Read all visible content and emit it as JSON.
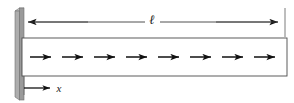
{
  "figure": {
    "kind": "cantilever-beam-diagram",
    "caption": "",
    "background_color": "#ffffff",
    "stroke_color": "#4a4a4a",
    "arrow_color": "#111111",
    "wall": {
      "label": "fixed-support-wall",
      "face_color": "#9a9a9a",
      "edge_color": "#6e6e6e",
      "top_color": "#c8c8c8",
      "x": 15,
      "y_top": 8,
      "y_bottom": 97,
      "width": 9
    },
    "dimension": {
      "label": "ℓ",
      "label_x": 152,
      "label_y": 20,
      "line_y": 22,
      "x_start": 22,
      "x_end": 284,
      "extension_line_x": 285,
      "extension_top": 8,
      "extension_bottom": 37
    },
    "beam": {
      "label": "beam-body",
      "x": 22,
      "y": 38,
      "width": 265,
      "height": 38,
      "fill": "#ffffff",
      "stroke": "#4a4a4a"
    },
    "flow_arrows": {
      "count": 8,
      "y": 57,
      "first_x": 30,
      "spacing": 32,
      "length": 21,
      "color": "#111111"
    },
    "x_axis": {
      "label": "x",
      "label_x": 59,
      "label_y": 92,
      "line_y": 88,
      "x_start": 24,
      "x_end": 52,
      "tick_x": 24,
      "tick_top": 76,
      "tick_bottom": 95
    }
  }
}
